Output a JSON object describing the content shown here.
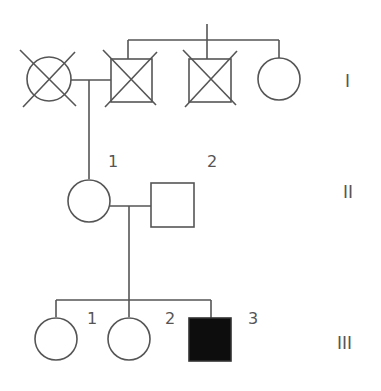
{
  "diagram": {
    "type": "pedigree",
    "colors": {
      "line": "#555555",
      "affected_fill": "#0d0d0d",
      "unaffected_fill": "#ffffff"
    },
    "generations": [
      {
        "label": "I"
      },
      {
        "label": "II"
      },
      {
        "label": "III"
      }
    ],
    "individuals": {
      "gen1": [
        {
          "sex": "female",
          "status": "deceased"
        },
        {
          "sex": "male",
          "status": "deceased"
        },
        {
          "sex": "male",
          "status": "deceased"
        },
        {
          "sex": "female",
          "status": "unaffected"
        }
      ],
      "gen2": [
        {
          "number": "1",
          "sex": "female",
          "status": "unaffected"
        },
        {
          "number": "2",
          "sex": "male",
          "status": "unaffected"
        }
      ],
      "gen3": [
        {
          "number": "1",
          "sex": "female",
          "status": "unaffected"
        },
        {
          "number": "2",
          "sex": "female",
          "status": "unaffected"
        },
        {
          "number": "3",
          "sex": "male",
          "status": "affected"
        }
      ]
    }
  }
}
